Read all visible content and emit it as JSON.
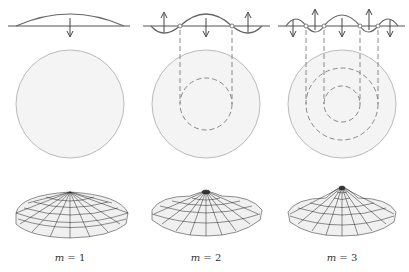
{
  "figure": {
    "colors": {
      "line": "#555555",
      "disk_fill": "#f3f3f3",
      "disk_stroke": "#bbbbbb",
      "dash": "#888888",
      "mesh": "#222222"
    },
    "modes": [
      {
        "m": 1,
        "label_var": "m",
        "label_eq": " = 1",
        "nodal_circles": 0
      },
      {
        "m": 2,
        "label_var": "m",
        "label_eq": " = 2",
        "nodal_circles": 1
      },
      {
        "m": 3,
        "label_var": "m",
        "label_eq": " = 3",
        "nodal_circles": 2
      }
    ]
  }
}
